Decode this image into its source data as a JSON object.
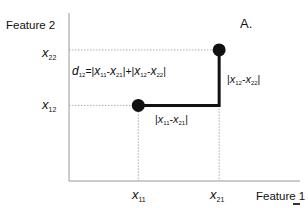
{
  "figure": {
    "panel_label": "A.",
    "x_axis_title": "Feature 1",
    "y_axis_title": "Feature 2",
    "colors": {
      "axis": "#9a9a9a",
      "guide": "#9a9a9a",
      "path": "#111111",
      "point": "#111111",
      "text": "#111111"
    }
  },
  "points": [
    {
      "id": "point-1",
      "x_label": {
        "var": "x",
        "sub": "11"
      },
      "y_label": {
        "var": "x",
        "sub": "12"
      },
      "x": 0.3,
      "y": 0.45
    },
    {
      "id": "point-2",
      "x_label": {
        "var": "x",
        "sub": "21"
      },
      "y_label": {
        "var": "x",
        "sub": "22"
      },
      "x": 0.65,
      "y": 0.78
    }
  ],
  "formula": {
    "lhs_var": "d",
    "lhs_sub": "12",
    "eq": "=",
    "t1_open": "|",
    "t1_a": "x",
    "t1_a_sub": "11",
    "t1_minus": "-",
    "t1_b": "x",
    "t1_b_sub": "21",
    "t1_close": "|",
    "plus": "+",
    "t2_open": "|",
    "t2_a": "x",
    "t2_a_sub": "12",
    "t2_minus": "-",
    "t2_b": "x",
    "t2_b_sub": "22",
    "t2_close": "|"
  },
  "segment_labels": {
    "horizontal": {
      "open": "|",
      "a": "x",
      "a_sub": "11",
      "minus": "-",
      "b": "x",
      "b_sub": "21",
      "close": "|"
    },
    "vertical": {
      "open": "|",
      "a": "x",
      "a_sub": "12",
      "minus": "-",
      "b": "x",
      "b_sub": "22",
      "close": "|"
    }
  }
}
